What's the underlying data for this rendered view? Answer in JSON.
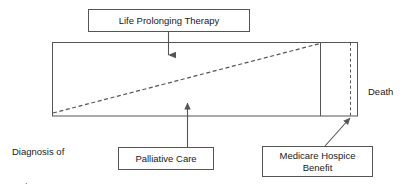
{
  "diagram": {
    "title_absent": true,
    "type": "illness-trajectory-care-model",
    "colors": {
      "stroke": "#555555",
      "text": "#1a1a1a",
      "background": "#ffffff"
    },
    "boxes": [
      {
        "id": "life-prolonging-therapy",
        "label": "Life Prolonging Therapy",
        "x": 88,
        "y": 9,
        "width": 162,
        "height": 23
      },
      {
        "id": "palliative-care",
        "label": "Palliative Care",
        "x": 118,
        "y": 147,
        "width": 96,
        "height": 23
      },
      {
        "id": "medicare-hospice-benefit",
        "label": "Medicare Hospice\nBenefit",
        "line1": "Medicare Hospice",
        "line2": "Benefit",
        "x": 262,
        "y": 146,
        "width": 111,
        "height": 31
      }
    ],
    "plain_labels": [
      {
        "id": "diagnosis",
        "text": "Diagnosis of\nserious\nillness",
        "line1": "Diagnosis of",
        "line2": "serious",
        "line3": "illness",
        "x": 12,
        "y": 123
      },
      {
        "id": "death",
        "text": "Death",
        "x": 368,
        "y": 86
      }
    ],
    "main_rectangle": {
      "x": 52,
      "y": 42,
      "width": 306,
      "height": 74,
      "description": "Care continuum timeline from diagnosis to death"
    },
    "divider_line": {
      "id": "hospice-start-divider",
      "x": 320,
      "y_top": 42,
      "y_bottom": 116,
      "style": "solid"
    },
    "death_line": {
      "id": "death-dashed-line",
      "x": 350,
      "y_top": 42,
      "y_bottom": 116,
      "style": "dashed"
    },
    "trajectory_line": {
      "id": "palliative-care-growth-line",
      "style": "dashed",
      "from": {
        "x": 53,
        "y": 113
      },
      "to": {
        "x": 320,
        "y": 43
      },
      "meaning": "Increasing palliative care share over illness course"
    },
    "arrows": [
      {
        "id": "arrow-life-prolonging-therapy",
        "direction": "down",
        "from": {
          "x": 168,
          "y": 32
        },
        "to": {
          "x": 168,
          "y": 63
        }
      },
      {
        "id": "arrow-palliative-care",
        "direction": "up",
        "from": {
          "x": 187,
          "y": 147
        },
        "to": {
          "x": 187,
          "y": 95
        }
      },
      {
        "id": "arrow-medicare-hospice-benefit",
        "direction": "up-right",
        "from": {
          "x": 325,
          "y": 146
        },
        "to": {
          "x": 352,
          "y": 117
        }
      }
    ]
  }
}
